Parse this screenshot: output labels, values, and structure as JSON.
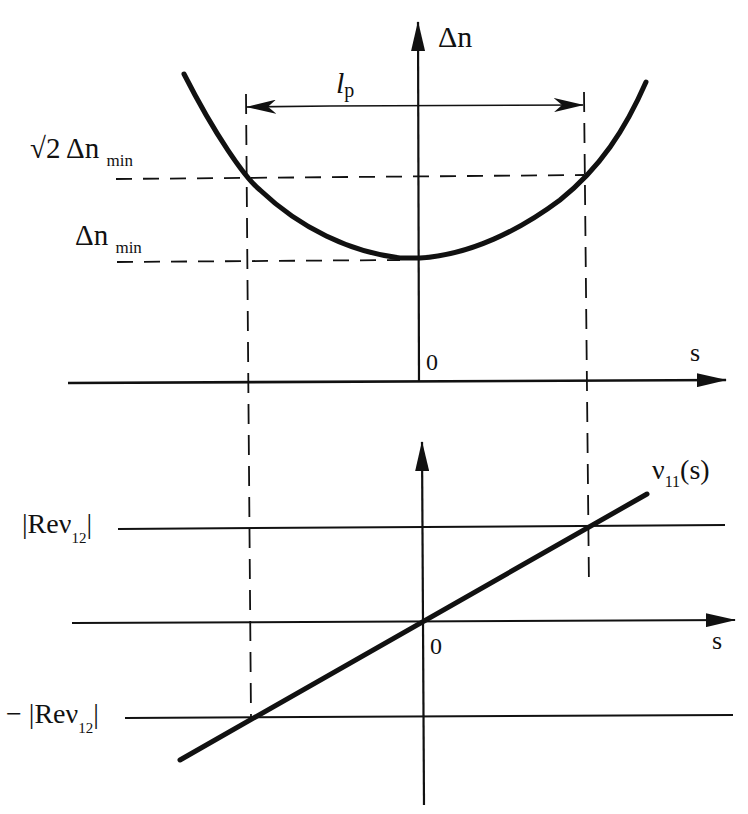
{
  "upper_plot": {
    "y_axis_label": "Δn",
    "x_axis_label": "s",
    "origin_label": "0",
    "width_label_main": "l",
    "width_label_sub": "p",
    "level_high_prefix": "√2 Δn",
    "level_high_sub": "min",
    "level_low_prefix": "Δn",
    "level_low_sub": "min",
    "curve": "parabola with minimum Δn_min at s = 0"
  },
  "lower_plot": {
    "x_axis_label": "s",
    "origin_label": "0",
    "curve_label_main": "ν",
    "curve_label_sub": "11",
    "curve_label_arg": "(s)",
    "upper_level_prefix": "|Reν",
    "upper_level_sub": "12",
    "upper_level_suffix": "|",
    "lower_level_prefix": "− |Reν",
    "lower_level_sub": "12",
    "lower_level_suffix": "|",
    "curve": "straight line through origin"
  },
  "colors": {
    "ink": "#111111",
    "background": "#ffffff"
  }
}
